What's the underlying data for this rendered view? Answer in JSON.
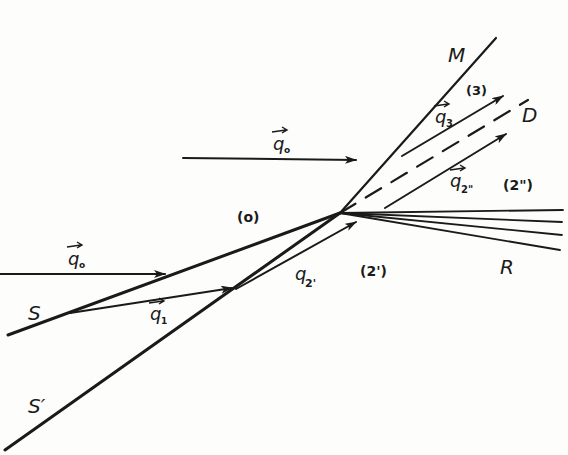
{
  "diagram": {
    "type": "vector shock-wave refraction diagram",
    "labels": {
      "M": "M",
      "D": "D",
      "R": "R",
      "S": "S",
      "S_prime": "S′",
      "region_0": "(o)",
      "region_2prime": "(2')",
      "region_2dprime": "(2\")",
      "region_3": "(3)",
      "q0_top": "q",
      "q0_top_sub": "o",
      "q0_left": "q",
      "q0_left_sub": "o",
      "q1": "q",
      "q1_sub": "1",
      "q2prime": "q",
      "q2prime_sub": "2'",
      "q2dprime": "q",
      "q2dprime_sub": "2\"",
      "q3": "q",
      "q3_sub": "3"
    },
    "colors": {
      "ink": "#1a1a1a",
      "paper": "#fdfdfb"
    }
  }
}
